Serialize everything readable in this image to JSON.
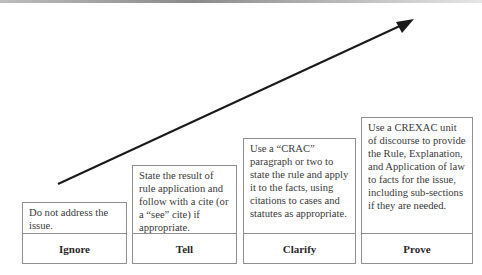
{
  "diagram": {
    "arrow": {
      "from": [
        58,
        184
      ],
      "to": [
        413,
        20
      ],
      "color": "#1a1a1a"
    },
    "steps": [
      {
        "label": "Ignore",
        "description": "Do not address the issue."
      },
      {
        "label": "Tell",
        "description": "State the result of rule application and follow with a cite (or a “see” cite) if appropriate."
      },
      {
        "label": "Clarify",
        "description": "Use a “CRAC” paragraph or two to state the rule and apply it to the facts, using citations to cases and statutes as appropriate."
      },
      {
        "label": "Prove",
        "description": "Use a CREXAC unit of discourse to provide the Rule, Explanation, and Application of law to facts for the issue, including sub-sections if they are needed."
      }
    ]
  }
}
